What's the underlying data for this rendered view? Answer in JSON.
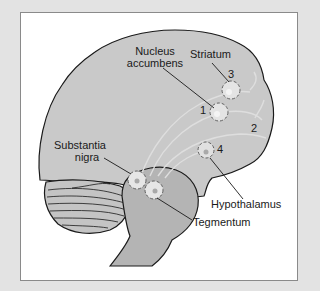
{
  "figure": {
    "labels": {
      "nucleus_accumbens_line1": "Nucleus",
      "nucleus_accumbens_line2": "accumbens",
      "striatum": "Striatum",
      "substantia_nigra_line1": "Substantia",
      "substantia_nigra_line2": "nigra",
      "hypothalamus": "Hypothalamus",
      "tegmentum": "Tegmentum"
    },
    "pathway_numbers": {
      "p1": "1",
      "p2": "2",
      "p3": "3",
      "p4": "4"
    },
    "colors": {
      "background": "#e3e3e3",
      "panel": "#ffffff",
      "brain_fill": "#c9c9c9",
      "brainstem_fill": "#b4b4b4",
      "outline": "#1a1a1a",
      "pathway": "#dcdcdc"
    }
  }
}
